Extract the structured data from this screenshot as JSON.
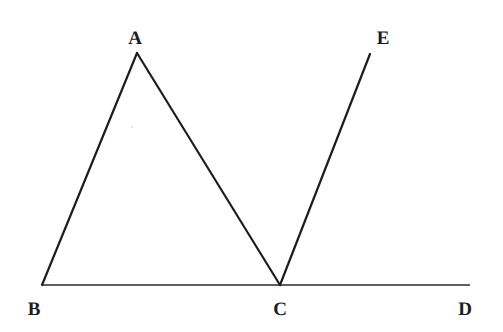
{
  "figure": {
    "background_color": "#ffffff",
    "stroke_color": "#1d1d1d",
    "baseline_color": "#2a2a2a",
    "width": 503,
    "height": 332
  },
  "points": {
    "A": {
      "label": "A",
      "x": 137,
      "y": 53,
      "label_x": 135,
      "label_y": 38
    },
    "B": {
      "label": "B",
      "x": 42,
      "y": 285,
      "label_x": 34,
      "label_y": 309
    },
    "C": {
      "label": "C",
      "x": 280,
      "y": 285,
      "label_x": 280,
      "label_y": 309
    },
    "D": {
      "label": "D",
      "x": 470,
      "y": 285,
      "label_x": 465,
      "label_y": 309
    },
    "E": {
      "label": "E",
      "x": 370,
      "y": 54,
      "label_x": 383,
      "label_y": 38
    }
  },
  "segments": [
    {
      "name": "segment-BD-baseline",
      "from": "B",
      "to": "D",
      "stroke_width": 1.4,
      "color": "#2a2a2a"
    },
    {
      "name": "segment-BA",
      "from": "B",
      "to": "A",
      "stroke_width": 2.2,
      "color": "#1d1d1d"
    },
    {
      "name": "segment-AC",
      "from": "A",
      "to": "C",
      "stroke_width": 2.2,
      "color": "#1d1d1d"
    },
    {
      "name": "segment-CE",
      "from": "C",
      "to": "E",
      "stroke_width": 2.2,
      "color": "#1d1d1d"
    }
  ],
  "artifacts": [
    {
      "name": "scan-speck",
      "x": 132,
      "y": 127,
      "size": 2
    }
  ]
}
